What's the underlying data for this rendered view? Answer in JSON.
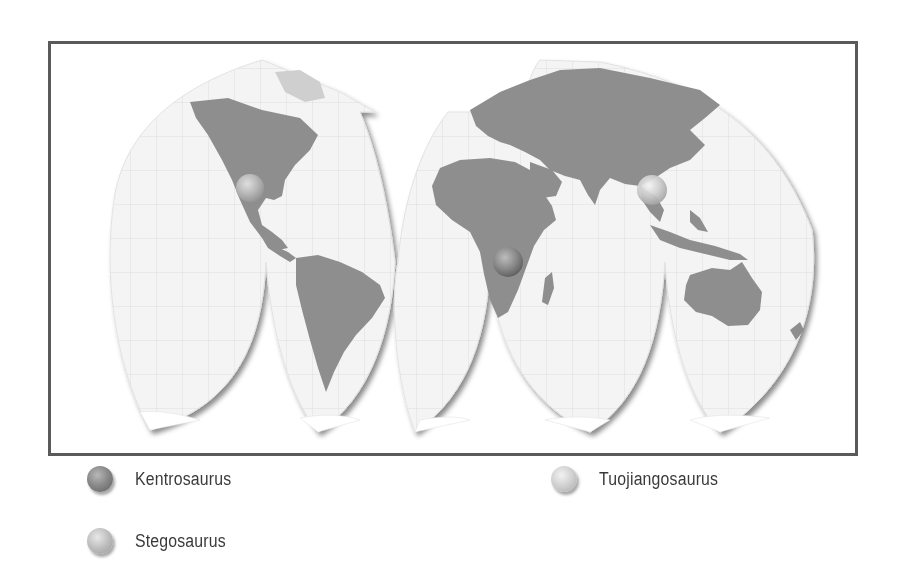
{
  "map": {
    "projection": "interrupted-goode-style",
    "colors": {
      "frame": "#5a5a5a",
      "ocean": "#f4f4f4",
      "land": "#8c8c8c",
      "graticule": "#d6d6d6",
      "ice": "#ffffff"
    },
    "markers": [
      {
        "species": "Stegosaurus",
        "region": "North America",
        "x": 250,
        "y": 188,
        "style": "stego"
      },
      {
        "species": "Kentrosaurus",
        "region": "Southern Africa",
        "x": 508,
        "y": 262,
        "style": "kentro"
      },
      {
        "species": "Tuojiangosaurus",
        "region": "China",
        "x": 652,
        "y": 190,
        "style": "tuo"
      }
    ]
  },
  "legend": {
    "items": [
      {
        "label": "Kentrosaurus",
        "style": "kentro"
      },
      {
        "label": "Tuojiangosaurus",
        "style": "tuo"
      },
      {
        "label": "Stegosaurus",
        "style": "stego"
      }
    ]
  }
}
